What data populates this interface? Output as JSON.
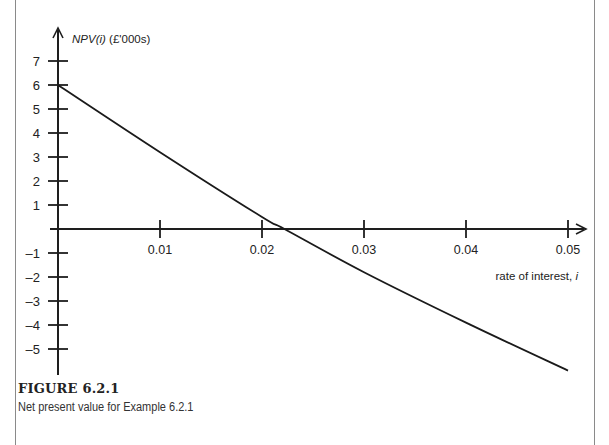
{
  "figure": {
    "label": "FIGURE 6.2.1",
    "caption": "Net present value for Example 6.2.1"
  },
  "chart_data": {
    "type": "line",
    "title": "",
    "xlabel": "rate of interest, i",
    "ylabel": "NPV(i) (£'000s)",
    "x_ticks": [
      "0.01",
      "0.02",
      "0.03",
      "0.04",
      "0.05"
    ],
    "y_ticks": [
      "7",
      "6",
      "5",
      "4",
      "3",
      "2",
      "1",
      "-1",
      "-2",
      "-3",
      "-4",
      "-5"
    ],
    "xlim": [
      0,
      0.05
    ],
    "ylim": [
      -6,
      7.5
    ],
    "grid": false,
    "legend": null,
    "series": [
      {
        "name": "NPV(i)",
        "x": [
          0,
          0.01,
          0.02,
          0.0222,
          0.03,
          0.04,
          0.05
        ],
        "y": [
          6.0,
          3.2,
          0.5,
          0.0,
          -1.8,
          -3.9,
          -5.9
        ]
      }
    ],
    "annotations": []
  },
  "axis": {
    "ylabel_italic": "NPV(i)",
    "ylabel_rest": " (£'000s)",
    "xlabel_text": "rate of interest, ",
    "xlabel_var": "i"
  }
}
